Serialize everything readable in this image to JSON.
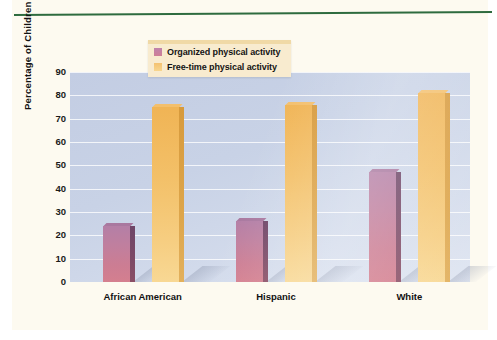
{
  "chart_data": {
    "type": "bar",
    "title": "",
    "xlabel": "",
    "ylabel": "Percentage of Children",
    "ylim": [
      0,
      90
    ],
    "ytick_step": 10,
    "grid": true,
    "legend_position": "top-center",
    "categories": [
      "African American",
      "Hispanic",
      "White"
    ],
    "series": [
      {
        "name": "Organized physical activity",
        "color": "#c47f9a",
        "values": [
          24,
          26,
          47
        ]
      },
      {
        "name": "Free-time physical activity",
        "color": "#f3c16a",
        "values": [
          75,
          76,
          81
        ]
      }
    ],
    "ytick_labels": [
      "0",
      "10",
      "20",
      "30",
      "40",
      "50",
      "60",
      "70",
      "80",
      "90"
    ]
  },
  "legend": {
    "items": [
      {
        "label": "Organized physical activity",
        "swatch": "purple-swatch"
      },
      {
        "label": "Free-time physical activity",
        "swatch": "yellow-swatch"
      }
    ]
  },
  "axes": {
    "y_title": "Percentage of Children"
  },
  "colors": {
    "page_background": "#fdfaf0",
    "plot_background": "#c8d2e6",
    "rule": "#2e6b3e",
    "organized": "#c47f9a",
    "free_time": "#f3c16a",
    "legend_background": "#f8ebcf"
  }
}
